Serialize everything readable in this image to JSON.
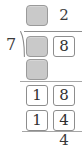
{
  "problem": {
    "kind": "long-division",
    "divisor": "7",
    "bracket_icon": "division-bracket-icon",
    "remainder_value": "4"
  },
  "quotient": {
    "tens": {
      "value": "",
      "filled": false,
      "placeholder": ""
    },
    "ones": {
      "value": "2",
      "filled": true
    }
  },
  "dividend": {
    "tens": {
      "value": "",
      "filled": false,
      "placeholder": ""
    },
    "ones": {
      "value": "8",
      "filled": true
    }
  },
  "product": {
    "tens": {
      "value": "",
      "filled": false,
      "placeholder": ""
    },
    "ones": {
      "value": "",
      "filled": false,
      "placeholder": ""
    }
  },
  "subtraction_row_1": {
    "tens": {
      "value": "1"
    },
    "ones": {
      "value": "8"
    }
  },
  "subtraction_row_2": {
    "tens": {
      "value": "1"
    },
    "ones": {
      "value": "4"
    }
  },
  "colors": {
    "blank_box_fill": "#c9c9c9",
    "blank_box_border": "#9a9a9a",
    "filled_box_border": "#8d8d8d",
    "rule": "#a6a6a6",
    "text": "#3a3a3a",
    "background": "#ffffff"
  }
}
